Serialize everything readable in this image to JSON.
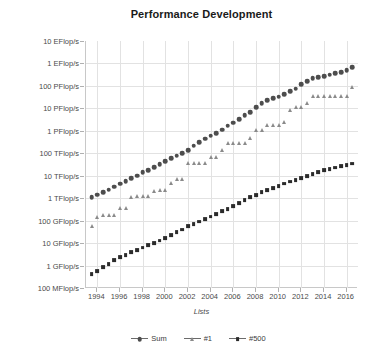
{
  "chart_data": {
    "type": "scatter",
    "title": "Performance Development",
    "xlabel": "Lists",
    "ylabel": "Performance",
    "grid": true,
    "legend_position": "bottom",
    "y_scale": "log",
    "ylim": [
      100000000,
      10000000000000000000
    ],
    "xlim": [
      1993,
      2017
    ],
    "y_ticks": [
      {
        "label": "10 EFlop/s",
        "value": 1e+19
      },
      {
        "label": "1 EFlop/s",
        "value": 1e+18
      },
      {
        "label": "100 PFlop/s",
        "value": 1e+17
      },
      {
        "label": "10 PFlop/s",
        "value": 1e+16
      },
      {
        "label": "1 PFlop/s",
        "value": 1000000000000000.0
      },
      {
        "label": "100 TFlop/s",
        "value": 100000000000000.0
      },
      {
        "label": "10 TFlop/s",
        "value": 10000000000000.0
      },
      {
        "label": "1 TFlop/s",
        "value": 1000000000000.0
      },
      {
        "label": "100 GFlop/s",
        "value": 100000000000.0
      },
      {
        "label": "10 GFlop/s",
        "value": 10000000000.0
      },
      {
        "label": "1 GFlop/s",
        "value": 1000000000.0
      },
      {
        "label": "100 MFlop/s",
        "value": 100000000.0
      }
    ],
    "x_ticks": [
      "1994",
      "1996",
      "1998",
      "2000",
      "2002",
      "2004",
      "2006",
      "2008",
      "2010",
      "2012",
      "2014",
      "2016"
    ],
    "series": [
      {
        "name": "Sum",
        "marker": "circle",
        "color": "#4d4d4d",
        "x": [
          1993.5,
          1994.0,
          1994.5,
          1995.0,
          1995.5,
          1996.0,
          1996.5,
          1997.0,
          1997.5,
          1998.0,
          1998.5,
          1999.0,
          1999.5,
          2000.0,
          2000.5,
          2001.0,
          2001.5,
          2002.0,
          2002.5,
          2003.0,
          2003.5,
          2004.0,
          2004.5,
          2005.0,
          2005.5,
          2006.0,
          2006.5,
          2007.0,
          2007.5,
          2008.0,
          2008.5,
          2009.0,
          2009.5,
          2010.0,
          2010.5,
          2011.0,
          2011.5,
          2012.0,
          2012.5,
          2013.0,
          2013.5,
          2014.0,
          2014.5,
          2015.0,
          2015.5,
          2016.0,
          2016.5
        ],
        "y": [
          1100000000000.0,
          1400000000000.0,
          1800000000000.0,
          2400000000000.0,
          3200000000000.0,
          4400000000000.0,
          5600000000000.0,
          7600000000000.0,
          10000000000000.0,
          14000000000000.0,
          18000000000000.0,
          24000000000000.0,
          32000000000000.0,
          44000000000000.0,
          60000000000000.0,
          78000000000000.0,
          100000000000000.0,
          140000000000000.0,
          220000000000000.0,
          320000000000000.0,
          440000000000000.0,
          600000000000000.0,
          800000000000000.0,
          1100000000000000.0,
          1700000000000000.0,
          2300000000000000.0,
          3200000000000000.0,
          4900000000000000.0,
          6900000000000000.0,
          1.1e+16,
          1.7e+16,
          2.3e+16,
          2.8e+16,
          3.3e+16,
          4.4e+16,
          5.9e+16,
          7.4e+16,
          1.2e+17,
          1.6e+17,
          2.2e+17,
          2.5e+17,
          2.7e+17,
          3.1e+17,
          3.6e+17,
          4.2e+17,
          5e+17,
          6.7e+17
        ]
      },
      {
        "name": "#1",
        "marker": "triangle",
        "color": "#8a8a8a",
        "x": [
          1993.5,
          1994.0,
          1994.5,
          1995.0,
          1995.5,
          1996.0,
          1996.5,
          1997.0,
          1997.5,
          1998.0,
          1998.5,
          1999.0,
          1999.5,
          2000.0,
          2000.5,
          2001.0,
          2001.5,
          2002.0,
          2002.5,
          2003.0,
          2003.5,
          2004.0,
          2004.5,
          2005.0,
          2005.5,
          2006.0,
          2006.5,
          2007.0,
          2007.5,
          2008.0,
          2008.5,
          2009.0,
          2009.5,
          2010.0,
          2010.5,
          2011.0,
          2011.5,
          2012.0,
          2012.5,
          2013.0,
          2013.5,
          2014.0,
          2014.5,
          2015.0,
          2015.5,
          2016.0,
          2016.5
        ],
        "y": [
          59000000000.0,
          140000000000.0,
          170000000000.0,
          170000000000.0,
          170000000000.0,
          370000000000.0,
          370000000000.0,
          1100000000000.0,
          1300000000000.0,
          1300000000000.0,
          1300000000000.0,
          2100000000000.0,
          2400000000000.0,
          2400000000000.0,
          4900000000000.0,
          7200000000000.0,
          7200000000000.0,
          36000000000000.0,
          36000000000000.0,
          36000000000000.0,
          36000000000000.0,
          71000000000000.0,
          71000000000000.0,
          140000000000000.0,
          280000000000000.0,
          280000000000000.0,
          280000000000000.0,
          280000000000000.0,
          480000000000000.0,
          1100000000000000.0,
          1100000000000000.0,
          1800000000000000.0,
          1800000000000000.0,
          1800000000000000.0,
          2600000000000000.0,
          8200000000000000.0,
          1.1e+16,
          1.1e+16,
          1.7e+16,
          3.4e+16,
          3.4e+16,
          3.4e+16,
          3.4e+16,
          3.4e+16,
          3.4e+16,
          3.4e+16,
          9.3e+16
        ]
      },
      {
        "name": "#500",
        "marker": "square",
        "color": "#2b2b2b",
        "x": [
          1993.5,
          1994.0,
          1994.5,
          1995.0,
          1995.5,
          1996.0,
          1996.5,
          1997.0,
          1997.5,
          1998.0,
          1998.5,
          1999.0,
          1999.5,
          2000.0,
          2000.5,
          2001.0,
          2001.5,
          2002.0,
          2002.5,
          2003.0,
          2003.5,
          2004.0,
          2004.5,
          2005.0,
          2005.5,
          2006.0,
          2006.5,
          2007.0,
          2007.5,
          2008.0,
          2008.5,
          2009.0,
          2009.5,
          2010.0,
          2010.5,
          2011.0,
          2011.5,
          2012.0,
          2012.5,
          2013.0,
          2013.5,
          2014.0,
          2014.5,
          2015.0,
          2015.5,
          2016.0,
          2016.5
        ],
        "y": [
          420000000.0,
          550000000.0,
          850000000.0,
          1200000000.0,
          1700000000.0,
          2400000000.0,
          3000000000.0,
          4000000000.0,
          5000000000.0,
          6300000000.0,
          8000000000.0,
          10000000000.0,
          13000000000.0,
          17000000000.0,
          23000000000.0,
          31000000000.0,
          40000000000.0,
          55000000000.0,
          70000000000.0,
          90000000000.0,
          120000000000.0,
          150000000000.0,
          200000000000.0,
          260000000000.0,
          330000000000.0,
          450000000000.0,
          600000000000.0,
          800000000000.0,
          1100000000000.0,
          1400000000000.0,
          1800000000000.0,
          2200000000000.0,
          2800000000000.0,
          3500000000000.0,
          4500000000000.0,
          5500000000000.0,
          6500000000000.0,
          8000000000000.0,
          10000000000000.0,
          12000000000000.0,
          15000000000000.0,
          18000000000000.0,
          20000000000000.0,
          23000000000000.0,
          26000000000000.0,
          30000000000000.0,
          35000000000000.0
        ]
      }
    ]
  },
  "legend": {
    "items": [
      {
        "label": "Sum"
      },
      {
        "label": "#1"
      },
      {
        "label": "#500"
      }
    ]
  }
}
